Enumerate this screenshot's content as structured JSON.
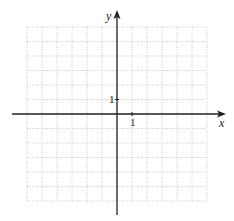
{
  "graph": {
    "x_axis_label": "x",
    "y_axis_label": "y",
    "x_tick_label": "1",
    "y_tick_label": "1",
    "grid": {
      "x_range": [
        -6,
        6
      ],
      "y_range": [
        -6,
        6
      ],
      "step": 1,
      "line_style": "dotted",
      "line_color": "#b8b8b8"
    },
    "axis_color": "#222222"
  },
  "chart_data": {
    "type": "scatter",
    "title": "",
    "xlabel": "x",
    "ylabel": "y",
    "xlim": [
      -6,
      6
    ],
    "ylim": [
      -6,
      6
    ],
    "grid": true,
    "tick_labels": {
      "x": [
        "1"
      ],
      "y": [
        "1"
      ]
    },
    "series": []
  }
}
